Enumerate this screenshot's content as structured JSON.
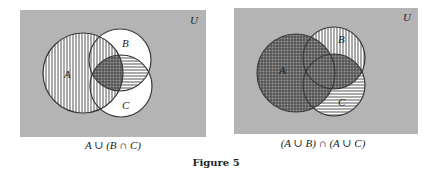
{
  "figure": {
    "title": "Figure 5"
  },
  "colors": {
    "universe": "#b4b4b4",
    "white": "#ffffff",
    "stroke": "#3a3a3a",
    "hatch": "#555555"
  },
  "diagrams": [
    {
      "caption": "A ∪ (B ∩ C)",
      "universe_label": "U",
      "universe": {
        "x": 20,
        "y": 10,
        "w": 186,
        "h": 127
      },
      "sets": [
        {
          "label": "A",
          "cx": 83,
          "cy": 73,
          "r": 40,
          "label_x": 68,
          "label_y": 78
        },
        {
          "label": "B",
          "cx": 120,
          "cy": 60,
          "r": 31,
          "label_x": 126,
          "label_y": 47
        },
        {
          "label": "C",
          "cx": 121,
          "cy": 86,
          "r": 31,
          "label_x": 126,
          "label_y": 109
        }
      ],
      "shading": {
        "A": "vertical lines",
        "B∩C": "horizontal lines",
        "A∩B∩C": "crosshatch"
      }
    },
    {
      "caption": "(A ∪ B) ∩ (A ∪ C)",
      "universe_label": "U",
      "universe": {
        "x": 234,
        "y": 8,
        "w": 184,
        "h": 126
      },
      "sets": [
        {
          "label": "A",
          "cx": 296,
          "cy": 73,
          "r": 39,
          "label_x": 282,
          "label_y": 72
        },
        {
          "label": "B",
          "cx": 334,
          "cy": 58,
          "r": 31,
          "label_x": 341,
          "label_y": 42
        },
        {
          "label": "C",
          "cx": 334,
          "cy": 85,
          "r": 31,
          "label_x": 341,
          "label_y": 104
        }
      ],
      "shading": {
        "A ∪ B": "vertical lines",
        "A ∪ C": "horizontal lines",
        "(A ∪ B) ∩ (A ∪ C)": "crosshatch"
      }
    }
  ]
}
